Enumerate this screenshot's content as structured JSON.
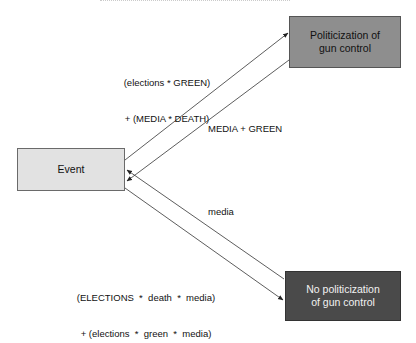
{
  "diagram": {
    "nodes": {
      "event": {
        "label": "Event",
        "fill": "#e2e2e2"
      },
      "politicization": {
        "label_line1": "Politicization of",
        "label_line2": "gun control",
        "fill": "#8e8e8e"
      },
      "no_politicization": {
        "label_line1": "No politicization",
        "label_line2": "of gun control",
        "fill": "#4a4a4a"
      }
    },
    "edges": [
      {
        "from": "Event",
        "to": "Politicization of gun control",
        "label_line1": "(elections * GREEN)",
        "label_line2": "+ (MEDIA * DEATH)"
      },
      {
        "from": "Politicization of gun control",
        "to": "Event",
        "label": "MEDIA + GREEN"
      },
      {
        "from": "No politicization of gun control",
        "to": "Event",
        "label": "media"
      },
      {
        "from": "Event",
        "to": "No politicization of gun control",
        "label_line1": "(ELECTIONS  *  death  *  media)",
        "label_line2": "+ (elections  *  green  *  media)"
      }
    ]
  }
}
